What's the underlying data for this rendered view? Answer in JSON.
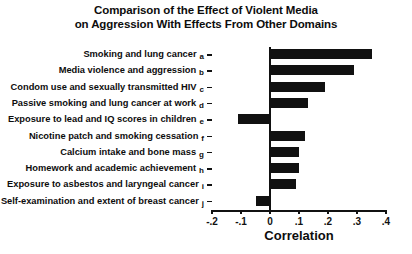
{
  "chart_data": {
    "type": "bar",
    "orientation": "horizontal",
    "title": "Comparison of the Effect of Violent Media on Aggression With Effects From Other Domains",
    "title_lines": [
      "Comparison of the Effect of Violent Media",
      "on Aggression With Effects From Other Domains"
    ],
    "xlabel": "Correlation",
    "ylabel": "",
    "xlim": [
      -0.2,
      0.4
    ],
    "xticks": [
      -0.2,
      -0.1,
      0,
      0.1,
      0.2,
      0.3,
      0.4
    ],
    "xtick_labels": [
      "-.2",
      "-.1",
      "0",
      ".1",
      ".2",
      ".3",
      ".4"
    ],
    "grid": false,
    "legend": false,
    "bar_color": "#111111",
    "categories": [
      "Smoking and lung cancer",
      "Media violence and aggression",
      "Condom use and sexually transmitted HIV",
      "Passive smoking and lung cancer at work",
      "Exposure to lead and IQ scores in children",
      "Nicotine patch and smoking cessation",
      "Calcium intake and bone mass",
      "Homework and academic achievement",
      "Exposure to asbestos and laryngeal cancer",
      "Self-examination and extent of breast cancer"
    ],
    "category_letters": [
      "a",
      "b",
      "c",
      "d",
      "e",
      "f",
      "g",
      "h",
      "i",
      "j"
    ],
    "values": [
      0.35,
      0.29,
      0.19,
      0.13,
      -0.11,
      0.12,
      0.1,
      0.1,
      0.09,
      -0.05
    ]
  }
}
